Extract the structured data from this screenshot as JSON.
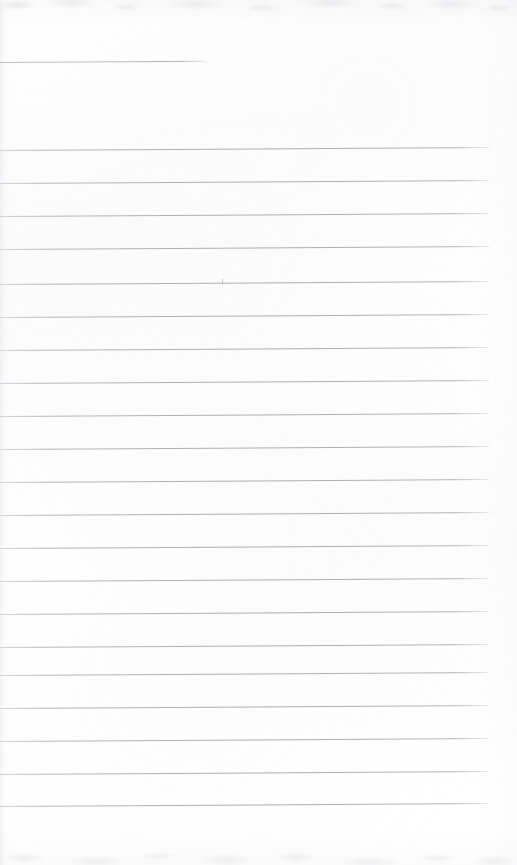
{
  "page": {
    "kind": "scanned-notebook-page",
    "width": 517,
    "height": 865,
    "paper_color": "#ffffff",
    "rule_color": "#c9c9cf",
    "rule_count_total": 22,
    "text_content": "",
    "skew_degrees": -0.35
  },
  "rules": {
    "partial": [
      {
        "id": "rule-top-partial",
        "x": 0,
        "y": 62,
        "width": 207
      }
    ],
    "full": [
      {
        "id": "rule-1",
        "x": 0,
        "y": 150,
        "width": 489
      },
      {
        "id": "rule-2",
        "x": 0,
        "y": 183,
        "width": 489
      },
      {
        "id": "rule-3",
        "x": 0,
        "y": 216,
        "width": 489
      },
      {
        "id": "rule-4",
        "x": 0,
        "y": 249,
        "width": 489
      },
      {
        "id": "rule-5",
        "x": 0,
        "y": 284,
        "width": 489
      },
      {
        "id": "rule-6",
        "x": 0,
        "y": 317,
        "width": 489
      },
      {
        "id": "rule-7",
        "x": 0,
        "y": 350,
        "width": 489
      },
      {
        "id": "rule-8",
        "x": 0,
        "y": 383,
        "width": 489
      },
      {
        "id": "rule-9",
        "x": 0,
        "y": 416,
        "width": 489
      },
      {
        "id": "rule-10",
        "x": 0,
        "y": 449,
        "width": 489
      },
      {
        "id": "rule-11",
        "x": 0,
        "y": 482,
        "width": 489
      },
      {
        "id": "rule-12",
        "x": 0,
        "y": 515,
        "width": 489
      },
      {
        "id": "rule-13",
        "x": 0,
        "y": 548,
        "width": 489
      },
      {
        "id": "rule-14",
        "x": 0,
        "y": 581,
        "width": 489
      },
      {
        "id": "rule-15",
        "x": 0,
        "y": 614,
        "width": 489
      },
      {
        "id": "rule-16",
        "x": 0,
        "y": 647,
        "width": 489
      },
      {
        "id": "rule-17",
        "x": 0,
        "y": 675,
        "width": 489
      },
      {
        "id": "rule-18",
        "x": 0,
        "y": 708,
        "width": 489
      },
      {
        "id": "rule-19",
        "x": 0,
        "y": 741,
        "width": 489
      },
      {
        "id": "rule-20",
        "x": 0,
        "y": 774,
        "width": 489
      },
      {
        "id": "rule-21",
        "x": 0,
        "y": 806,
        "width": 489
      }
    ]
  },
  "marks": {
    "stray_tick": {
      "id": "stray-tick",
      "x": 222,
      "y": 279
    }
  }
}
